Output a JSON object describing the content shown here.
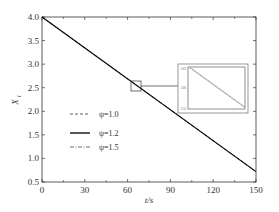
{
  "chart_data": {
    "type": "line",
    "title": "",
    "xlabel": "t/s",
    "ylabel": "X_t",
    "xlim": [
      0,
      150
    ],
    "ylim": [
      0.5,
      4.0
    ],
    "xticks": [
      "0",
      "30",
      "60",
      "90",
      "120",
      "150"
    ],
    "yticks": [
      "0.5",
      "1.0",
      "1.5",
      "2.0",
      "2.5",
      "3.0",
      "3.5",
      "4.0"
    ],
    "grid": false,
    "legend_position": "lower-left inside",
    "series": [
      {
        "name": "ψ=1.0",
        "style": "dashed",
        "x": [
          0,
          150
        ],
        "y": [
          4.0,
          0.72
        ]
      },
      {
        "name": "ψ=1.2",
        "style": "solid",
        "x": [
          0,
          150
        ],
        "y": [
          4.0,
          0.72
        ]
      },
      {
        "name": "ψ=1.5",
        "style": "dash-dot",
        "x": [
          0,
          150
        ],
        "y": [
          4.0,
          0.72
        ]
      }
    ],
    "inset": {
      "description": "zoom of region around t≈66, X≈2.55",
      "yticks": [
        "2.55",
        "2.60",
        "2.65"
      ]
    }
  },
  "legend": {
    "items": [
      {
        "label": "ψ=1.0"
      },
      {
        "label": "ψ=1.2"
      },
      {
        "label": "ψ=1.5"
      }
    ]
  },
  "axes": {
    "xlabel": "t/s",
    "ylabel_main": "X",
    "ylabel_sub": "t"
  }
}
